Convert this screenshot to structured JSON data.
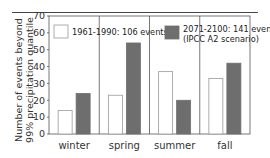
{
  "chart_data": {
    "type": "bar",
    "title": "",
    "xlabel": "",
    "ylabel": "Number of events beyond 99% precipitation quantile",
    "ylabel_lines": [
      "Number of events beyond",
      "99% precipitation quantile"
    ],
    "ylim": [
      0,
      70
    ],
    "yticks": [
      0,
      10,
      20,
      30,
      40,
      50,
      60,
      70
    ],
    "grid": false,
    "categories": [
      "winter",
      "spring",
      "summer",
      "fall"
    ],
    "series": [
      {
        "name": "1961-1990: 106 events",
        "color": "#ffffff",
        "edge": "#999999",
        "values": [
          14,
          23,
          37,
          33
        ]
      },
      {
        "name": "2071-2100: 141 events (IPCC A2 scenario)",
        "color": "#6e6e6e",
        "edge": "#6e6e6e",
        "values": [
          24,
          54,
          20,
          42
        ]
      }
    ],
    "legend": {
      "placement": "top",
      "entries": [
        {
          "lines": [
            "1961-1990: 106 events"
          ]
        },
        {
          "lines": [
            "2071-2100: 141 events",
            "(IPCC A2 scenario)"
          ]
        }
      ]
    }
  }
}
